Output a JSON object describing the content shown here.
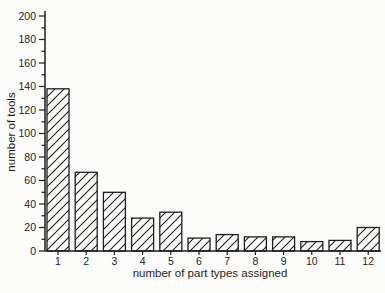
{
  "figure": {
    "kind": "scanned-statistical-histogram",
    "background": "#fcfcfb",
    "ink_color": "#1e1e1e"
  },
  "chart_data": {
    "type": "bar",
    "title": "",
    "xlabel": "number of part types assigned",
    "ylabel": "number of tools",
    "categories": [
      "1",
      "2",
      "3",
      "4",
      "5",
      "6",
      "7",
      "8",
      "9",
      "10",
      "11",
      "12"
    ],
    "values": [
      138,
      67,
      50,
      28,
      33,
      11,
      14,
      12,
      12,
      8,
      9,
      20
    ],
    "ylim": [
      0,
      200
    ],
    "y_major_step": 20,
    "y_minor_step": 10,
    "y_tick_labels": [
      "0",
      "20",
      "40",
      "60",
      "80",
      "100",
      "120",
      "140",
      "160",
      "180",
      "200"
    ],
    "grid": false,
    "legend_position": "none",
    "bar_style": "diagonal-hatch",
    "hatch_direction": "/"
  }
}
